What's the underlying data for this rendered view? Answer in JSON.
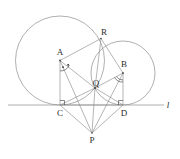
{
  "figure": {
    "background_color": "#ffffff",
    "stroke_color": "#8d8d8d",
    "label_color": "#2b2b2b",
    "width": 180,
    "height": 159
  },
  "line": {
    "name": "l",
    "label": "l",
    "label_x": 168,
    "label_y": 108,
    "x1": 8,
    "y1": 105,
    "x2": 164,
    "y2": 105
  },
  "circles": [
    {
      "id": "circle-a",
      "center_label": "A",
      "cx": 60,
      "cy": 60.5,
      "r": 44.5,
      "tangent_point": "C"
    },
    {
      "id": "circle-b",
      "center_label": "B",
      "cx": 123,
      "cy": 73,
      "r": 32,
      "tangent_point": "D"
    }
  ],
  "points": [
    {
      "id": "A",
      "label": "A",
      "x": 60,
      "y": 60.5,
      "label_x": 60,
      "label_y": 55,
      "role": "center-left-circle"
    },
    {
      "id": "B",
      "label": "B",
      "x": 123,
      "y": 73,
      "label_x": 124,
      "label_y": 67,
      "role": "center-right-circle"
    },
    {
      "id": "C",
      "label": "C",
      "x": 60,
      "y": 105,
      "label_x": 60,
      "label_y": 116,
      "role": "tangent-left"
    },
    {
      "id": "D",
      "label": "D",
      "x": 123,
      "y": 105,
      "label_x": 124,
      "label_y": 116,
      "role": "tangent-right"
    },
    {
      "id": "Q",
      "label": "Q",
      "x": 95,
      "y": 88,
      "label_x": 96,
      "label_y": 86,
      "role": "intersection-lower"
    },
    {
      "id": "R",
      "label": "R",
      "x": 101,
      "y": 38.5,
      "label_x": 104,
      "label_y": 35,
      "role": "intersection-upper"
    },
    {
      "id": "P",
      "label": "P",
      "x": 92,
      "y": 133,
      "label_x": 92,
      "label_y": 143,
      "role": "external-point"
    }
  ],
  "segments": [
    {
      "id": "A-C",
      "from": "A",
      "to": "C"
    },
    {
      "id": "A-Q",
      "from": "A",
      "to": "Q"
    },
    {
      "id": "A-R",
      "from": "A",
      "to": "R"
    },
    {
      "id": "A-P",
      "from": "A",
      "to": "P"
    },
    {
      "id": "B-D",
      "from": "B",
      "to": "D"
    },
    {
      "id": "B-Q",
      "from": "B",
      "to": "Q"
    },
    {
      "id": "B-R",
      "from": "B",
      "to": "R"
    },
    {
      "id": "B-P",
      "from": "B",
      "to": "P"
    },
    {
      "id": "C-Q",
      "from": "C",
      "to": "Q"
    },
    {
      "id": "D-Q",
      "from": "D",
      "to": "Q"
    },
    {
      "id": "C-P",
      "from": "C",
      "to": "P"
    },
    {
      "id": "D-P",
      "from": "D",
      "to": "P"
    },
    {
      "id": "Q-P",
      "from": "Q",
      "to": "P"
    },
    {
      "id": "Q-R",
      "from": "Q",
      "to": "R"
    },
    {
      "id": "C-D",
      "from": "C",
      "to": "D"
    }
  ],
  "angle_marks": [
    {
      "id": "right-angle-C",
      "type": "right-angle",
      "at": "C",
      "size": 4.5
    },
    {
      "id": "right-angle-D",
      "type": "right-angle",
      "at": "D",
      "size": 4.5
    },
    {
      "id": "angle-A",
      "type": "arc-with-dots",
      "at": "A"
    },
    {
      "id": "angle-B",
      "type": "arc",
      "at": "B"
    }
  ]
}
